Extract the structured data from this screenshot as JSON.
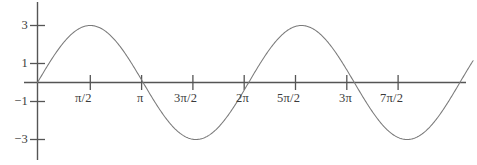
{
  "chart_data": {
    "type": "line",
    "title": "",
    "subtitle": "",
    "xlabel": "",
    "ylabel": "",
    "function": "y = 3 sin(x)",
    "amplitude": 3,
    "period": "2π",
    "grid": false,
    "legend": null,
    "xlim": [
      -0.25,
      13.2
    ],
    "ylim": [
      -3.9,
      4.3
    ],
    "x_ticks": [
      {
        "value": 1.5707963,
        "label": "π/2"
      },
      {
        "value": 3.1415927,
        "label": "π"
      },
      {
        "value": 4.712389,
        "label": "3π/2"
      },
      {
        "value": 6.2831853,
        "label": "2π"
      },
      {
        "value": 7.8539816,
        "label": "5π/2"
      },
      {
        "value": 9.424778,
        "label": "3π"
      },
      {
        "value": 10.9955743,
        "label": "7π/2"
      }
    ],
    "y_ticks": [
      {
        "value": 3,
        "label": "3"
      },
      {
        "value": 1,
        "label": "1"
      },
      {
        "value": -1,
        "label": "−1"
      },
      {
        "value": -3,
        "label": "−3"
      }
    ],
    "series": [
      {
        "name": "3 sin(x)",
        "color": "#7a7a7a",
        "x": [
          0,
          0.3926991,
          0.7853982,
          1.1780972,
          1.5707963,
          1.9634954,
          2.3561945,
          2.7488936,
          3.1415927,
          3.5342917,
          3.9269908,
          4.3196899,
          4.712389,
          5.1050881,
          5.4977871,
          5.8904862,
          6.2831853,
          6.6758844,
          7.0685835,
          7.4612826,
          7.8539816,
          8.2466807,
          8.6393798,
          9.0320789,
          9.424778,
          9.817477,
          10.2101761,
          10.6028752,
          10.9955743,
          11.3882734,
          11.7809725,
          12.1736715,
          12.5663706,
          12.9590697
        ],
        "y": [
          0,
          1.1480503,
          2.1213203,
          2.7716386,
          3,
          2.7716386,
          2.1213203,
          1.1480503,
          0,
          -1.1480503,
          -2.1213203,
          -2.7716386,
          -3,
          -2.7716386,
          -2.1213203,
          -1.1480503,
          0,
          1.1480503,
          2.1213203,
          2.7716386,
          3,
          2.7716386,
          2.1213203,
          1.1480503,
          0,
          -1.1480503,
          -2.1213203,
          -2.7716386,
          -3,
          -2.7716386,
          -2.1213203,
          -1.1480503,
          0,
          1.1480503
        ]
      }
    ],
    "axes": {
      "axis_color": "#555555",
      "x_axis_label": "",
      "y_axis_label": ""
    }
  },
  "colors": {
    "background": "#ffffff",
    "curve": "#7a7a7a",
    "axis": "#555555",
    "text": "#3a3a3a"
  }
}
